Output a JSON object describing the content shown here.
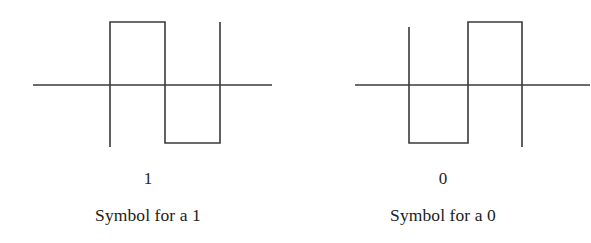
{
  "figure": {
    "type": "waveform-diagram",
    "background_color": "#ffffff",
    "stroke_color": "#3a3a3a",
    "text_color": "#1c1c1c"
  },
  "panels": [
    {
      "id": "symbol-one",
      "symbol_value": "1",
      "caption": "Symbol for a 1",
      "waveform": {
        "description": "positive pulse followed by negative pulse",
        "baseline_y": 85,
        "high_y": 22,
        "low_y": 143,
        "axis_x_start": 33,
        "axis_x_end": 272,
        "edges_x": [
          110,
          165,
          220
        ],
        "levels": [
          "high",
          "low"
        ],
        "path": "M 110,22 L 165,22 L 165,143 L 220,143 L 220,22",
        "stub_top_x": 110,
        "stub_top_y": 22,
        "stub_bottom_x": 110,
        "stub_bottom_y": 147,
        "stub2_x": 220,
        "stub2_y": 22
      }
    },
    {
      "id": "symbol-zero",
      "symbol_value": "0",
      "caption": "Symbol for a 0",
      "waveform": {
        "description": "negative pulse followed by positive pulse",
        "baseline_y": 85,
        "high_y": 22,
        "low_y": 143,
        "axis_x_start": 60,
        "axis_x_end": 295,
        "edges_x": [
          114,
          173,
          227
        ],
        "levels": [
          "low",
          "high"
        ],
        "path": "M 114,27 L 114,143 L 173,143 L 173,22 L 227,22 L 227,147",
        "stub_top_x": 114,
        "stub_top_y": 27,
        "stub_bottom_x": 227,
        "stub_bottom_y": 147
      }
    }
  ]
}
